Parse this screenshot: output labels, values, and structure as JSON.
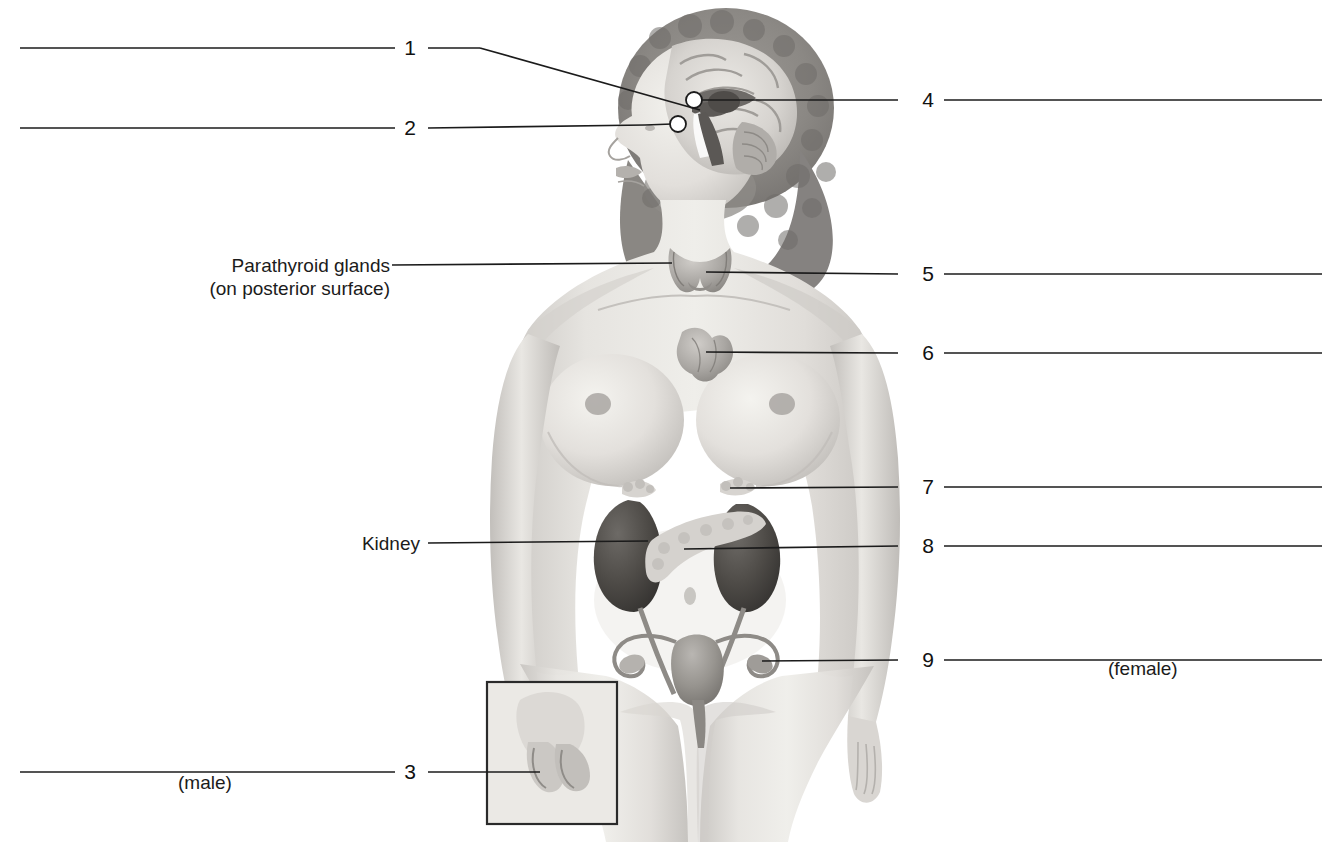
{
  "figure": {
    "kind": "anatomy-worksheet",
    "background_color": "#ffffff",
    "line_color": "#1b1b1b",
    "text_color": "#1b1b1b"
  },
  "named_labels": [
    {
      "id": "parathyroid",
      "line1": "Parathyroid glands",
      "line2": "(on posterior surface)",
      "leader_from_x": 392,
      "leader_from_y": 265,
      "leader_to_x": 672,
      "leader_to_y": 263
    },
    {
      "id": "kidney",
      "line1": "Kidney",
      "line2": "",
      "leader_from_x": 428,
      "leader_from_y": 543,
      "leader_to_x": 648,
      "leader_to_y": 541
    }
  ],
  "numbered_labels": [
    {
      "number": "1",
      "side": "left",
      "blank_x1": 20,
      "blank_x2": 395,
      "blank_y": 48,
      "num_x": 405,
      "num_y": 48,
      "tick_x1": 428,
      "tick_y": 48
    },
    {
      "number": "2",
      "side": "left",
      "blank_x1": 20,
      "blank_x2": 395,
      "blank_y": 128,
      "num_x": 405,
      "num_y": 128,
      "tick_x1": 428,
      "tick_y": 128
    },
    {
      "number": "3",
      "side": "left",
      "blank_x1": 20,
      "blank_x2": 395,
      "blank_y": 772,
      "num_x": 405,
      "num_y": 772,
      "tick_x1": 428,
      "tick_y": 772
    },
    {
      "number": "4",
      "side": "right",
      "blank_x1": 944,
      "blank_x2": 1322,
      "blank_y": 100,
      "num_x": 928,
      "num_y": 100,
      "tick_x1": 898,
      "tick_y": 100
    },
    {
      "number": "5",
      "side": "right",
      "blank_x1": 944,
      "blank_x2": 1322,
      "blank_y": 274,
      "num_x": 928,
      "num_y": 274,
      "tick_x1": 898,
      "tick_y": 274
    },
    {
      "number": "6",
      "side": "right",
      "blank_x1": 944,
      "blank_x2": 1322,
      "blank_y": 353,
      "num_x": 928,
      "num_y": 353,
      "tick_x1": 898,
      "tick_y": 353
    },
    {
      "number": "7",
      "side": "right",
      "blank_x1": 944,
      "blank_x2": 1322,
      "blank_y": 487,
      "num_x": 928,
      "num_y": 487,
      "tick_x1": 898,
      "tick_y": 487
    },
    {
      "number": "8",
      "side": "right",
      "blank_x1": 944,
      "blank_x2": 1322,
      "blank_y": 546,
      "num_x": 928,
      "num_y": 546,
      "tick_x1": 898,
      "tick_y": 546
    },
    {
      "number": "9",
      "side": "right",
      "blank_x1": 944,
      "blank_x2": 1322,
      "blank_y": 660,
      "num_x": 928,
      "num_y": 660,
      "tick_x1": 898,
      "tick_y": 660
    }
  ],
  "annotations": [
    {
      "id": "male",
      "text": "(male)",
      "x": 178,
      "y": 783
    },
    {
      "id": "female",
      "text": "(female)",
      "x": 1108,
      "y": 669
    }
  ],
  "organs": [
    {
      "id": "brain",
      "name": "brain (sagittal section)"
    },
    {
      "id": "hypothalamus",
      "name": "hypothalamus marker"
    },
    {
      "id": "pituitary-gland",
      "name": "pituitary gland marker"
    },
    {
      "id": "pineal-gland",
      "name": "pineal gland marker"
    },
    {
      "id": "thyroid-gland",
      "name": "thyroid gland"
    },
    {
      "id": "thymus",
      "name": "thymus"
    },
    {
      "id": "adrenal-glands",
      "name": "adrenal glands"
    },
    {
      "id": "kidneys",
      "name": "kidneys"
    },
    {
      "id": "pancreas",
      "name": "pancreas"
    },
    {
      "id": "ovaries-uterus",
      "name": "uterus, fallopian tubes and ovaries"
    },
    {
      "id": "testes-inset",
      "name": "testes inset box"
    }
  ]
}
